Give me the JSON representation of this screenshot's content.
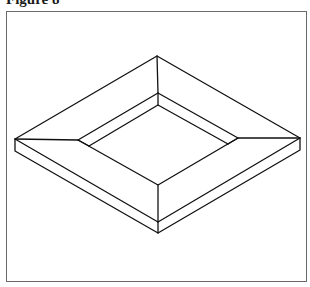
{
  "figure": {
    "title": "Figure 8"
  },
  "colors": {
    "line": "#111111",
    "frame_border": "#6a6a6a",
    "background": "#ffffff"
  },
  "geometry": {
    "outer_top_face": [
      [
        157,
        56
      ],
      [
        300,
        138
      ],
      [
        158,
        222
      ],
      [
        15,
        139
      ]
    ],
    "slab_bottom": [
      [
        15,
        151
      ],
      [
        158,
        233
      ],
      [
        300,
        150
      ]
    ],
    "rim": [
      [
        158,
        93
      ],
      [
        238,
        138
      ],
      [
        158,
        185
      ],
      [
        78,
        140
      ]
    ],
    "well_floor": [
      [
        158,
        105
      ],
      [
        228,
        144
      ],
      [
        158,
        185
      ],
      [
        89,
        146
      ]
    ]
  }
}
